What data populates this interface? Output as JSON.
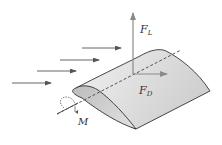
{
  "diagram": {
    "labels": {
      "lift": {
        "main": "F",
        "sub": "L"
      },
      "drag": {
        "main": "F",
        "sub": "D"
      },
      "moment": "M"
    },
    "flow_arrows": 4,
    "colors": {
      "airfoil_fill": "#d9d9d9",
      "airfoil_light": "#eeeeee",
      "outline": "#333333",
      "force_arrow": "#8a8a8a",
      "flow_arrow": "#555555",
      "axis_dashed": "#444444"
    }
  }
}
